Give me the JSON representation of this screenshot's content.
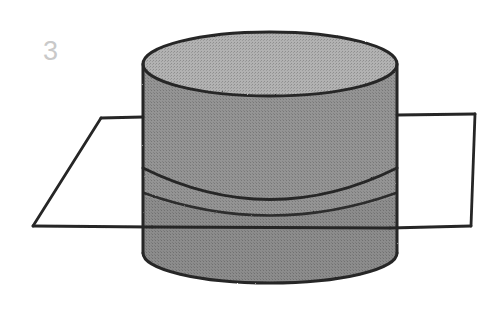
{
  "figure": {
    "label": "3",
    "label_color": "#c9c9c9",
    "background_color": "#ffffff",
    "ink_color": "#2b2b2b",
    "caption_alt": "cylinder intersected by a plane",
    "colors": {
      "cylinder_top_face": "#a9a9a9",
      "cylinder_body_upper": "#8f8f8f",
      "cylinder_body_lower": "#8a8a8a",
      "outline": "#262626",
      "plane_fill": "#ffffff"
    },
    "geometry": {
      "cylinder": {
        "center_x": 270,
        "radius_x": 127,
        "top_center_y": 64,
        "top_radius_y": 32,
        "bottom_center_y": 253,
        "bottom_radius_y": 30,
        "left_x": 143,
        "right_x": 397
      },
      "cut_ellipse": {
        "center_x": 270,
        "left_x": 143,
        "right_x": 397,
        "edge_y": 168,
        "sag_y": 196
      },
      "plane": {
        "top_left": [
          101,
          118
        ],
        "top_right": [
          475,
          114
        ],
        "bottom_right": [
          471,
          226
        ],
        "bottom_left": [
          33,
          226
        ],
        "front_edge_y": 226,
        "back_edge_y": 116
      }
    },
    "strokes": {
      "outline_width": 3.0,
      "plane_width": 2.6
    }
  }
}
